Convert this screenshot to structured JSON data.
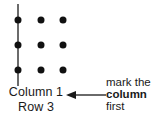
{
  "diagram": {
    "colors": {
      "dot": "#111111",
      "line": "#6b6b6b",
      "text": "#1a1a1a",
      "background": "#ffffff"
    },
    "grid": {
      "rows": 3,
      "columns": 3,
      "dot_points": [
        {
          "row": 1,
          "column": 1,
          "x": 18,
          "y": 20,
          "on_marked_line": true
        },
        {
          "row": 1,
          "column": 2,
          "x": 41,
          "y": 20,
          "on_marked_line": false
        },
        {
          "row": 1,
          "column": 3,
          "x": 63,
          "y": 20,
          "on_marked_line": false
        },
        {
          "row": 2,
          "column": 1,
          "x": 18,
          "y": 45,
          "on_marked_line": true
        },
        {
          "row": 2,
          "column": 2,
          "x": 41,
          "y": 45,
          "on_marked_line": false
        },
        {
          "row": 2,
          "column": 3,
          "x": 63,
          "y": 45,
          "on_marked_line": false
        },
        {
          "row": 3,
          "column": 1,
          "x": 18,
          "y": 70,
          "on_marked_line": true
        },
        {
          "row": 3,
          "column": 2,
          "x": 41,
          "y": 70,
          "on_marked_line": false
        },
        {
          "row": 3,
          "column": 3,
          "x": 63,
          "y": 70,
          "on_marked_line": false
        }
      ],
      "marked_column_line": {
        "x": 18,
        "y_start": 4,
        "y_end": 86,
        "marks_column": 1
      }
    },
    "labels": {
      "column_label": "Column 1",
      "row_label": "Row 3"
    },
    "callout": {
      "arrow_direction": "left",
      "line_1": "mark the",
      "line_2": "column",
      "line_2_emphasis": "bold",
      "line_3": "first"
    }
  }
}
